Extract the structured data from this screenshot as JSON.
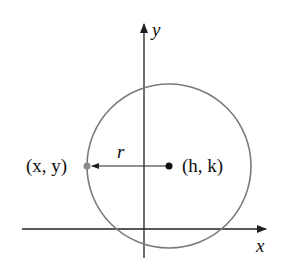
{
  "diagram": {
    "axes": {
      "x_label": "x",
      "y_label": "y"
    },
    "labels": {
      "point": "(x, y)",
      "center": "(h, k)",
      "radius": "r"
    },
    "colors": {
      "circle": "#7a7a7a",
      "point": "#8a8a8a",
      "center": "#111111",
      "axes": "#222222"
    }
  }
}
